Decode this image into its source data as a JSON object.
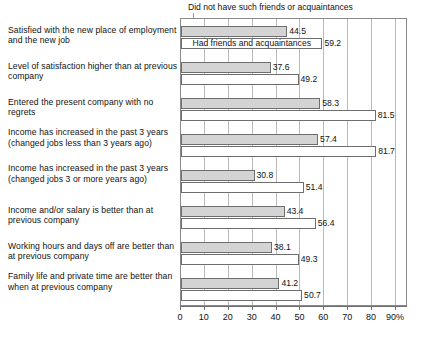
{
  "chart_data": {
    "type": "bar",
    "orientation": "horizontal",
    "title": "",
    "xlabel": "",
    "ylabel": "",
    "xlim": [
      0,
      90
    ],
    "xunit": "%",
    "grid": true,
    "xticks": [
      0,
      10,
      20,
      30,
      40,
      50,
      60,
      70,
      80,
      90
    ],
    "xtick_labels": [
      "0",
      "10",
      "20",
      "30",
      "40",
      "50",
      "60",
      "70",
      "80",
      "90%"
    ],
    "legend_position": "inline-callout",
    "categories": [
      "Satisfied with the new place of employment and the new job",
      "Level of satisfaction higher than at previous company",
      "Entered the present company with no regrets",
      "Income has increased in the past 3 years (changed jobs less than 3 years ago)",
      "Income has increased in the past 3 years (changed jobs 3 or more years ago)",
      "Income and/or salary is better than at previous company",
      "Working hours and days off are better than at previous company",
      "Family life and private time are better than when at previous company"
    ],
    "series": [
      {
        "name": "Did not have such friends or acquaintances",
        "color": "#d4d4d4",
        "values": [
          44.5,
          37.6,
          58.3,
          57.4,
          30.8,
          43.4,
          38.1,
          41.2
        ]
      },
      {
        "name": "Had friends and acquaintances",
        "color": "#ffffff",
        "values": [
          59.2,
          49.2,
          81.5,
          81.7,
          51.4,
          56.4,
          49.3,
          50.7
        ]
      }
    ],
    "annotations": [
      {
        "text": "Did not have such friends or acquaintances",
        "kind": "callout-top"
      },
      {
        "text": "Had friends and acquaintances",
        "kind": "inline-bar-label"
      }
    ]
  },
  "labels": {
    "categories": [
      "Satisfied with the new place of employment and the new job",
      "Level of satisfaction higher than at previous company",
      "Entered the present company with no regrets",
      "Income has increased in the past 3 years (changed jobs less than 3 years ago)",
      "Income has increased in the past 3 years (changed jobs 3 or more years ago)",
      "Income and/or salary is better than at previous company",
      "Working hours and days off are better than at previous company",
      "Family life and private time are better than when at previous company"
    ],
    "values_gray": [
      "44.5",
      "37.6",
      "58.3",
      "57.4",
      "30.8",
      "43.4",
      "38.1",
      "41.2"
    ],
    "values_white": [
      "59.2",
      "49.2",
      "81.5",
      "81.7",
      "51.4",
      "56.4",
      "49.3",
      "50.7"
    ],
    "legend_top": "Did not have such friends or acquaintances",
    "legend_inline": "Had friends and acquaintances",
    "xtick_labels": [
      "0",
      "10",
      "20",
      "30",
      "40",
      "50",
      "60",
      "70",
      "80",
      "90%"
    ]
  },
  "colors": {
    "series_gray": "#d4d4d4",
    "series_white": "#ffffff",
    "bar_border": "#6e6e6e",
    "gridline": "#b9b9b9",
    "frame": "#8a8a8a",
    "text": "#111111"
  }
}
